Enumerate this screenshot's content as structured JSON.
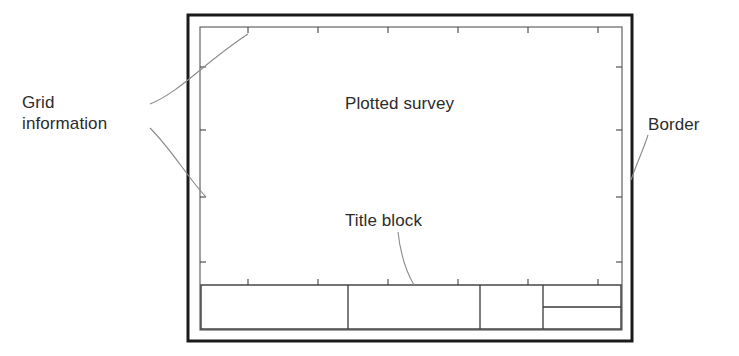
{
  "diagram": {
    "labels": {
      "grid_information": "Grid\ninformation",
      "border": "Border",
      "plotted_survey": "Plotted survey",
      "title_block": "Title block"
    },
    "colors": {
      "line": "#1a1a1a",
      "thin_line": "#555555",
      "leader_line": "#7a7a7a",
      "text": "#2b2b2b",
      "background": "#ffffff"
    },
    "geometry": {
      "outer_border": {
        "x": 188,
        "y": 15,
        "width": 444,
        "height": 326,
        "stroke_width": 3
      },
      "inner_grid_frame": {
        "x": 200,
        "y": 27,
        "width": 422,
        "height": 303,
        "stroke_width": 1
      },
      "title_block": {
        "x": 201,
        "y": 285,
        "width": 420,
        "height": 44
      },
      "title_block_dividers_x": [
        348,
        480,
        543
      ],
      "title_block_sub_row_y": 307,
      "ticks_top_x": [
        248,
        318,
        388,
        458,
        528,
        598
      ],
      "ticks_bottom_x": [
        248,
        318,
        388,
        458,
        528,
        598
      ],
      "ticks_left_y": [
        67,
        130,
        197,
        262
      ],
      "ticks_right_y": [
        67,
        130,
        197,
        262
      ]
    }
  }
}
